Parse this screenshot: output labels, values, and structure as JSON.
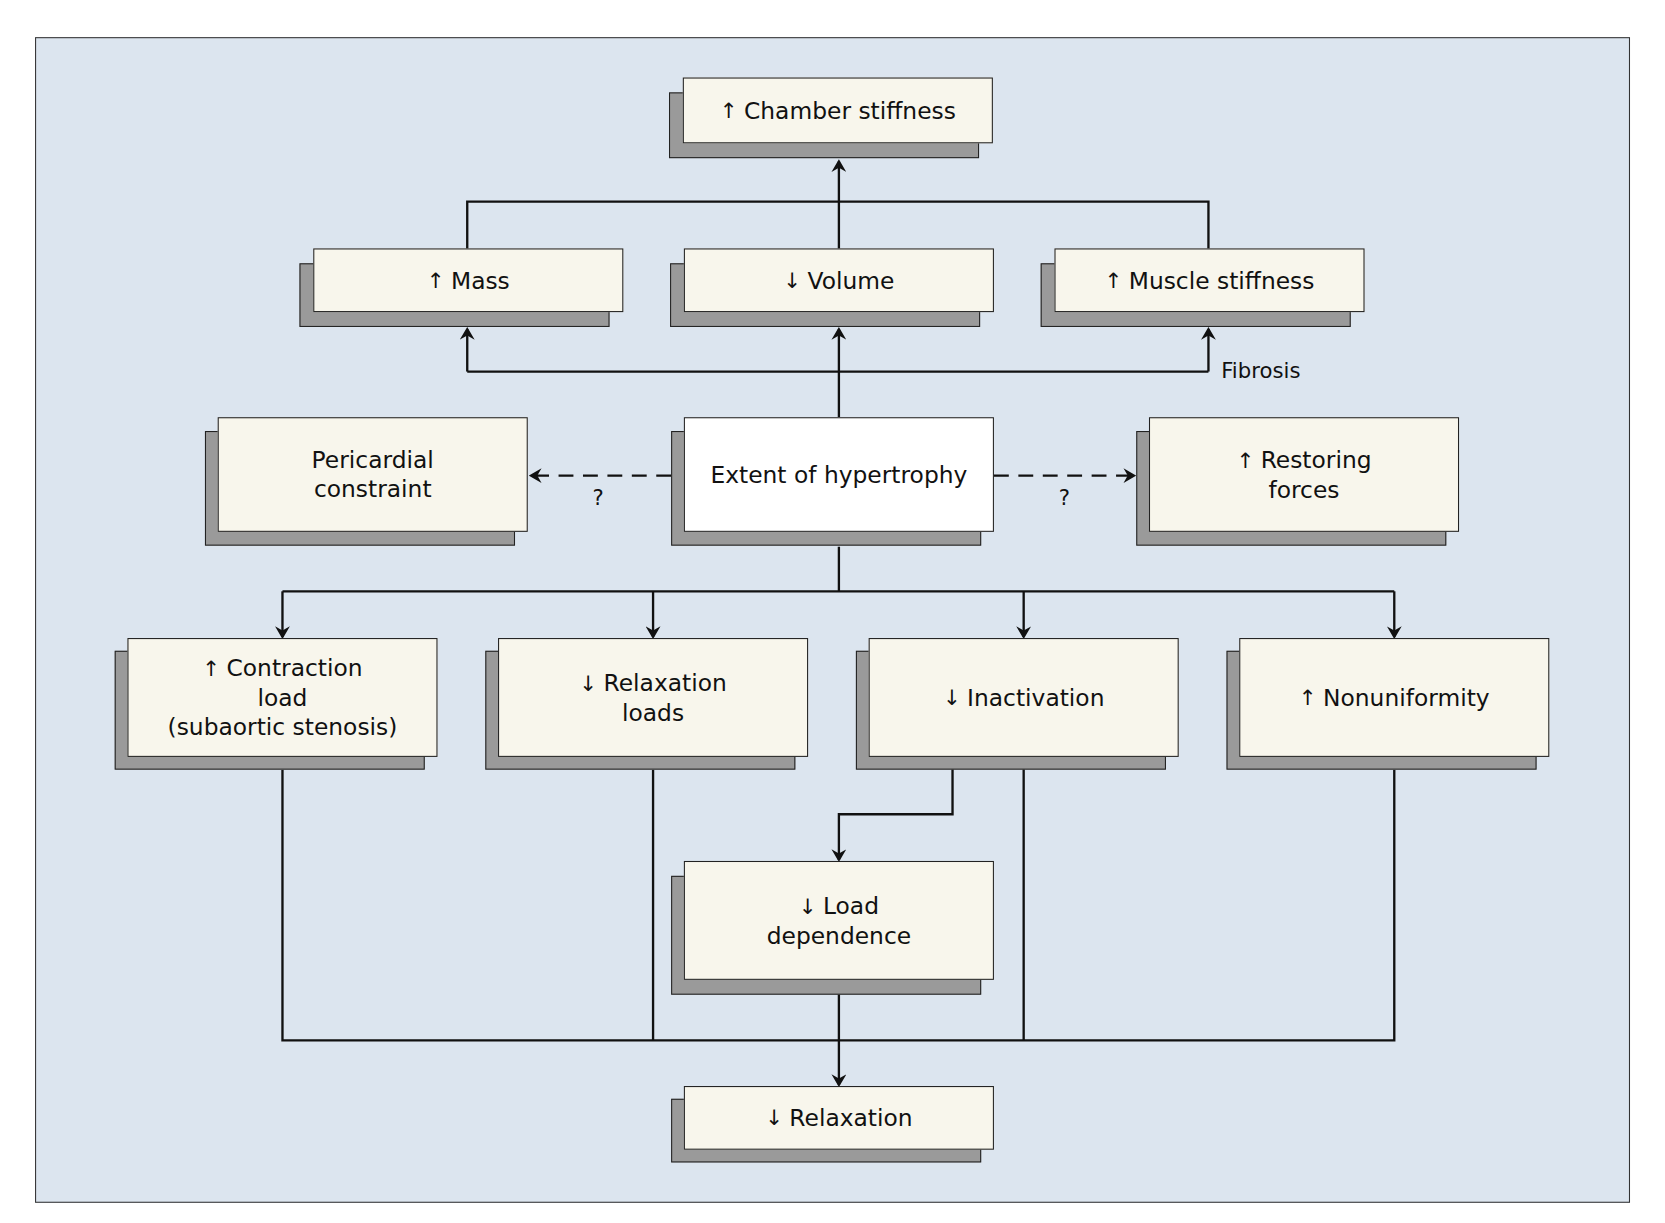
{
  "diagram": {
    "type": "flowchart",
    "background_color": "#dce5ef",
    "box_fill": "#f8f6ec",
    "central_box_fill": "#ffffff",
    "shadow_color": "#9a9a9a",
    "nodes": {
      "chamber_stiffness": {
        "arrow": "↑",
        "text": "Chamber stiffness"
      },
      "mass": {
        "arrow": "↑",
        "text": "Mass"
      },
      "volume": {
        "arrow": "↓",
        "text": "Volume"
      },
      "muscle_stiffness": {
        "arrow": "↑",
        "text": "Muscle stiffness"
      },
      "pericardial_constraint": {
        "line1": "Pericardial",
        "line2": "constraint"
      },
      "extent_of_hypertrophy": {
        "text": "Extent of hypertrophy"
      },
      "restoring_forces": {
        "arrow": "↑",
        "line1": "Restoring",
        "line2": "forces"
      },
      "contraction_load": {
        "arrow": "↑",
        "line1": "Contraction",
        "line2": "load",
        "line3": "(subaortic stenosis)"
      },
      "relaxation_loads": {
        "arrow": "↓",
        "line1": "Relaxation",
        "line2": "loads"
      },
      "inactivation": {
        "arrow": "↓",
        "text": "Inactivation"
      },
      "nonuniformity": {
        "arrow": "↑",
        "text": "Nonuniformity"
      },
      "load_dependence": {
        "arrow": "↓",
        "line1": "Load",
        "line2": "dependence"
      },
      "relaxation": {
        "arrow": "↓",
        "text": "Relaxation"
      }
    },
    "edge_labels": {
      "fibrosis": "Fibrosis",
      "pericardial_question": "?",
      "restoring_question": "?"
    },
    "edges": [
      {
        "from": "extent_of_hypertrophy",
        "to": "mass",
        "style": "solid"
      },
      {
        "from": "extent_of_hypertrophy",
        "to": "volume",
        "style": "solid"
      },
      {
        "from": "extent_of_hypertrophy",
        "to": "muscle_stiffness",
        "style": "solid",
        "label": "Fibrosis"
      },
      {
        "from": "mass",
        "to": "chamber_stiffness",
        "style": "solid"
      },
      {
        "from": "volume",
        "to": "chamber_stiffness",
        "style": "solid"
      },
      {
        "from": "muscle_stiffness",
        "to": "chamber_stiffness",
        "style": "solid"
      },
      {
        "from": "extent_of_hypertrophy",
        "to": "pericardial_constraint",
        "style": "dashed",
        "label": "?"
      },
      {
        "from": "extent_of_hypertrophy",
        "to": "restoring_forces",
        "style": "dashed",
        "label": "?"
      },
      {
        "from": "extent_of_hypertrophy",
        "to": "contraction_load",
        "style": "solid"
      },
      {
        "from": "extent_of_hypertrophy",
        "to": "relaxation_loads",
        "style": "solid"
      },
      {
        "from": "extent_of_hypertrophy",
        "to": "inactivation",
        "style": "solid"
      },
      {
        "from": "extent_of_hypertrophy",
        "to": "nonuniformity",
        "style": "solid"
      },
      {
        "from": "inactivation",
        "to": "load_dependence",
        "style": "solid"
      },
      {
        "from": "contraction_load",
        "to": "relaxation",
        "style": "solid"
      },
      {
        "from": "relaxation_loads",
        "to": "relaxation",
        "style": "solid"
      },
      {
        "from": "inactivation",
        "to": "relaxation",
        "style": "solid"
      },
      {
        "from": "nonuniformity",
        "to": "relaxation",
        "style": "solid"
      },
      {
        "from": "load_dependence",
        "to": "relaxation",
        "style": "solid"
      }
    ]
  }
}
